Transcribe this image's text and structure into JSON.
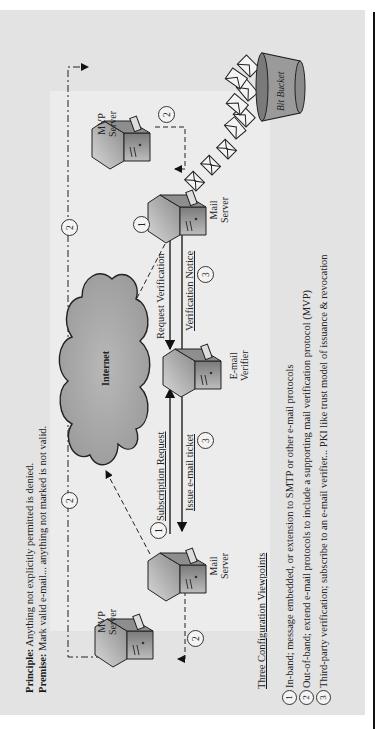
{
  "header": {
    "principle_label": "Principle:",
    "principle_text": "Anything not explicitly permitted is denied.",
    "premise_label": "Premise:",
    "premise_text": "Mark valid e-mail... anything not marked is not valid."
  },
  "nodes": {
    "mvp_server_left": {
      "line1": "MVP",
      "line2": "Server"
    },
    "mail_server_left": {
      "line1": "Mail",
      "line2": "Server"
    },
    "internet": {
      "label": "Internet"
    },
    "email_verifier": {
      "line1": "E-mail",
      "line2": "Verifier"
    },
    "mail_server_right": {
      "line1": "Mail",
      "line2": "Server"
    },
    "mvp_server_right": {
      "line1": "MVP",
      "line2": "Server"
    },
    "bit_bucket": {
      "label": "Bit Bucket"
    }
  },
  "arrows": {
    "subscription_request": "Subscription Request",
    "issue_ticket": "Issue e-mail ticket",
    "request_verification": "Request Verification",
    "verification_notice": "Verification Notice"
  },
  "markers": {
    "left_mvp": "2",
    "top_left": "2",
    "top_right": "2",
    "right_mvp": "2",
    "left_inband": "1",
    "right_inband": "1",
    "left_third": "3",
    "right_third": "3"
  },
  "legend": {
    "title": "Three Configuration Viewpoints",
    "items": [
      {
        "num": "1",
        "text": "In-band; message embedded, or extension to SMTP or other e-mail protocols"
      },
      {
        "num": "2",
        "text": "Out-of-band; extend e-mail protocols to include a supporting mail verification protocol (MVP)"
      },
      {
        "num": "3",
        "text": "Third-party verification; subscribe to an e-mail verifier... PKI like trust model of issuance & revocation"
      }
    ]
  },
  "colors": {
    "panel": "#e3e3e3",
    "cloud": "#a9a9a9",
    "line": "#222222"
  }
}
